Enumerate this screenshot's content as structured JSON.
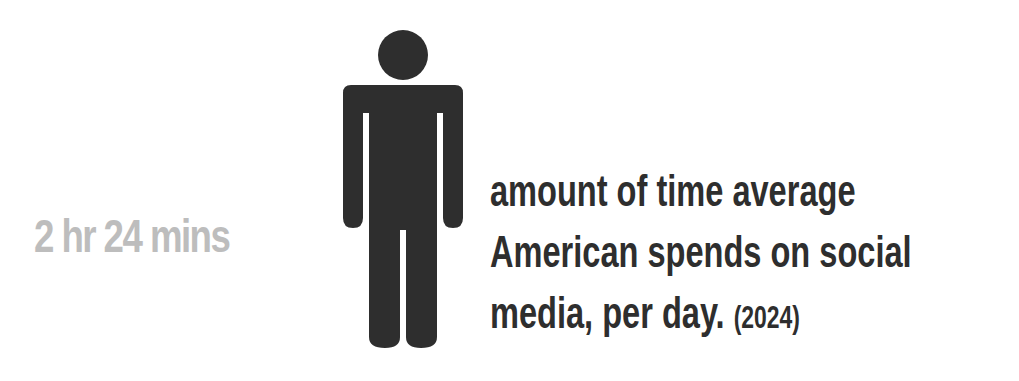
{
  "stat": {
    "value": "2 hr 24 mins",
    "color": "#bdbdbd"
  },
  "figure": {
    "icon": "person-icon",
    "color": "#2e2e2e"
  },
  "description": {
    "line1": "amount of time average",
    "line2": "American spends on social",
    "line3": "media, per day.",
    "year": "(2024)",
    "color": "#2e2e2e"
  }
}
